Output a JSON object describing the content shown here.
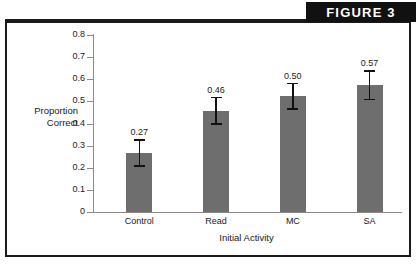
{
  "figure": {
    "banner_label": "FIGURE 3"
  },
  "chart_data": {
    "type": "bar",
    "title": "",
    "subtitle": "",
    "xlabel": "Initial Activity",
    "ylabel": "Proportion Correct",
    "ylabel_line1": "Proportion",
    "ylabel_line2": "Correct",
    "categories": [
      "Control",
      "Read",
      "MC",
      "SA"
    ],
    "values": [
      0.27,
      0.46,
      0.5,
      0.57
    ],
    "value_labels": [
      "0.27",
      "0.46",
      "0.50",
      "0.57"
    ],
    "bar_tops": [
      0.265,
      0.457,
      0.523,
      0.573
    ],
    "error_low": [
      0.208,
      0.398,
      0.466,
      0.508
    ],
    "error_high": [
      0.325,
      0.517,
      0.58,
      0.638
    ],
    "ylim": [
      0,
      0.8
    ],
    "ytick_values": [
      0.8,
      0.7,
      0.6,
      0.5,
      0.4,
      0.3,
      0.2,
      0.1,
      0
    ],
    "ytick_labels": [
      "0.8",
      "0.7",
      "0.6",
      "0.5",
      "0.4",
      "0.3",
      "0.2",
      "0.1",
      "0"
    ],
    "grid": false,
    "legend": null,
    "bar_color": "#6e6e6e",
    "axis_color": "#8a8a8a",
    "text_color": "#1a1a1a",
    "error_bar_color": "#111111"
  }
}
